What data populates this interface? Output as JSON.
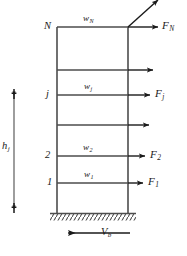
{
  "figure": {
    "type": "structural-frame-diagram",
    "stroke_color": "#4d4d4d",
    "text_color": "#1a1a1a",
    "arrow_color": "#1a1a1a"
  },
  "geometry": {
    "left_column_x": 57,
    "right_column_x": 128,
    "top_y": 27,
    "base_y": 213,
    "foundation_left": 52,
    "foundation_right": 134,
    "dimension_line_x": 14,
    "dimension_top_y": 92,
    "dimension_bottom_y": 210
  },
  "levels": [
    {
      "id": "N",
      "label": "N",
      "y": 27,
      "weight": "w",
      "weight_sub": "N",
      "force": "F",
      "force_sub": "N",
      "labeled": true,
      "arrow_x_start": 128,
      "arrow_x_end": 160
    },
    {
      "id": "n1",
      "label": "",
      "y": 70,
      "weight": "",
      "weight_sub": "",
      "force": "",
      "force_sub": "",
      "labeled": false,
      "arrow_x_start": 128,
      "arrow_x_end": 155
    },
    {
      "id": "j",
      "label": "j",
      "y": 95,
      "weight": "w",
      "weight_sub": "j",
      "force": "F",
      "force_sub": "j",
      "labeled": true,
      "arrow_x_start": 128,
      "arrow_x_end": 152
    },
    {
      "id": "n2",
      "label": "",
      "y": 125,
      "weight": "",
      "weight_sub": "",
      "force": "",
      "force_sub": "",
      "labeled": false,
      "arrow_x_start": 128,
      "arrow_x_end": 151
    },
    {
      "id": "2",
      "label": "2",
      "y": 156,
      "weight": "w",
      "weight_sub": "2",
      "force": "F",
      "force_sub": "2",
      "labeled": true,
      "arrow_x_start": 128,
      "arrow_x_end": 147
    },
    {
      "id": "1",
      "label": "1",
      "y": 183,
      "weight": "w",
      "weight_sub": "1",
      "force": "F",
      "force_sub": "1",
      "labeled": true,
      "arrow_x_start": 128,
      "arrow_x_end": 145
    }
  ],
  "labels": {
    "level_N": "N",
    "level_j": "j",
    "level_2": "2",
    "level_1": "1",
    "weight_N": "w",
    "weight_N_sub": "N",
    "weight_j": "w",
    "weight_j_sub": "j",
    "weight_2": "w",
    "weight_2_sub": "2",
    "weight_1": "w",
    "weight_1_sub": "1",
    "force_N": "F",
    "force_N_sub": "N",
    "force_j": "F",
    "force_j_sub": "j",
    "force_2": "F",
    "force_2_sub": "2",
    "force_1": "F",
    "force_1_sub": "1",
    "height_j": "h",
    "height_j_sub": "j",
    "base_shear": "V",
    "base_shear_sub": "b"
  },
  "base_shear_arrow": {
    "x_start": 130,
    "x_end": 66,
    "y": 233,
    "direction": "left"
  }
}
